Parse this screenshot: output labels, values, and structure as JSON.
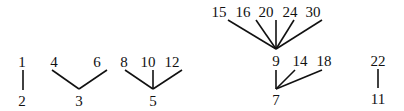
{
  "diagram": {
    "type": "forest",
    "trees": [
      {
        "root": {
          "id": "n2",
          "label": "2",
          "x": 22,
          "y": 106
        },
        "children": [
          {
            "id": "n1",
            "label": "1",
            "x": 22,
            "y": 67
          }
        ],
        "edges": [
          [
            23,
            70,
            23,
            90
          ]
        ]
      },
      {
        "root": {
          "id": "n3",
          "label": "3",
          "x": 79,
          "y": 106
        },
        "children": [
          {
            "id": "n4",
            "label": "4",
            "x": 54,
            "y": 67
          },
          {
            "id": "n6",
            "label": "6",
            "x": 97,
            "y": 67
          }
        ],
        "edges": [
          [
            52,
            70,
            79,
            89
          ],
          [
            107,
            70,
            79,
            89
          ]
        ]
      },
      {
        "root": {
          "id": "n5",
          "label": "5",
          "x": 153,
          "y": 106
        },
        "children": [
          {
            "id": "n8",
            "label": "8",
            "x": 124,
            "y": 67
          },
          {
            "id": "n10",
            "label": "10",
            "x": 148,
            "y": 67
          },
          {
            "id": "n12",
            "label": "12",
            "x": 172,
            "y": 67
          }
        ],
        "edges": [
          [
            125,
            70,
            153,
            89
          ],
          [
            153,
            70,
            153,
            89
          ],
          [
            182,
            70,
            153,
            89
          ]
        ]
      },
      {
        "root": {
          "id": "n9",
          "label": "9",
          "x": 276,
          "y": 66
        },
        "children": [
          {
            "id": "n15",
            "label": "15",
            "x": 219,
            "y": 17
          },
          {
            "id": "n16",
            "label": "16",
            "x": 243,
            "y": 17
          },
          {
            "id": "n20",
            "label": "20",
            "x": 266,
            "y": 17
          },
          {
            "id": "n24",
            "label": "24",
            "x": 290,
            "y": 17
          },
          {
            "id": "n30",
            "label": "30",
            "x": 313,
            "y": 17
          }
        ],
        "edges": [
          [
            228,
            20,
            276,
            49
          ],
          [
            256,
            20,
            276,
            49
          ],
          [
            276,
            20,
            276,
            49
          ],
          [
            294,
            20,
            276,
            49
          ],
          [
            322,
            20,
            276,
            49
          ]
        ]
      },
      {
        "root": {
          "id": "n7",
          "label": "7",
          "x": 276,
          "y": 105
        },
        "children": [
          {
            "id": "n9b",
            "label": "9",
            "ref": "n9"
          },
          {
            "id": "n14",
            "label": "14",
            "x": 300,
            "y": 66
          },
          {
            "id": "n18",
            "label": "18",
            "x": 324,
            "y": 66
          }
        ],
        "edges": [
          [
            276,
            70,
            276,
            89
          ],
          [
            295,
            70,
            276,
            89
          ],
          [
            322,
            70,
            276,
            89
          ]
        ]
      },
      {
        "root": {
          "id": "n11",
          "label": "11",
          "x": 378,
          "y": 104
        },
        "children": [
          {
            "id": "n22",
            "label": "22",
            "x": 378,
            "y": 66
          }
        ],
        "edges": [
          [
            378,
            69,
            378,
            88
          ]
        ]
      }
    ],
    "labels": {
      "n1": "1",
      "n2": "2",
      "n3": "3",
      "n4": "4",
      "n5": "5",
      "n6": "6",
      "n7": "7",
      "n8": "8",
      "n9": "9",
      "n10": "10",
      "n11": "11",
      "n12": "12",
      "n14": "14",
      "n15": "15",
      "n16": "16",
      "n18": "18",
      "n20": "20",
      "n22": "22",
      "n24": "24",
      "n30": "30"
    },
    "colors": {
      "ink": "#111111",
      "background": "#ffffff"
    }
  }
}
